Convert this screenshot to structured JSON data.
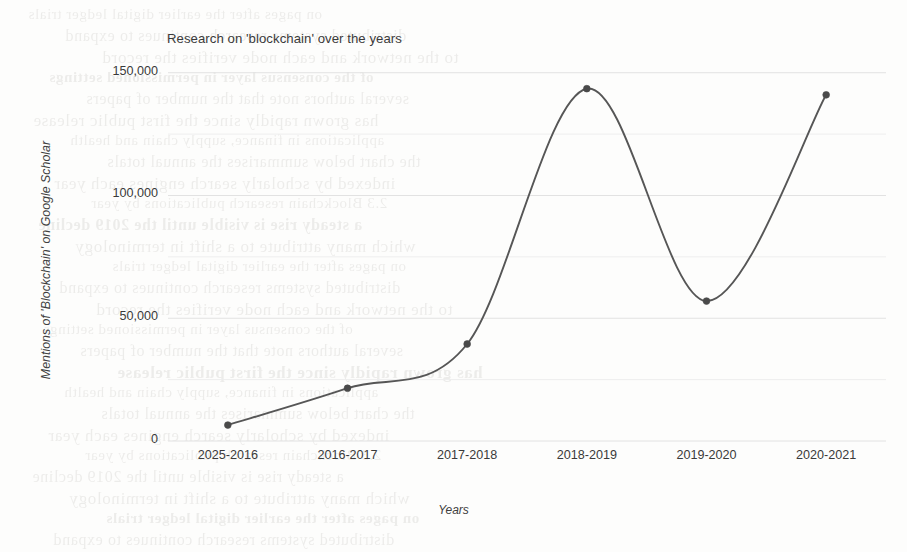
{
  "page": {
    "background_color": "#fdfdfc",
    "ghost_text": [
      "on pages after the earlier digital ledger trials",
      "distributed systems research continues to expand",
      "to the network and each node verifies the record",
      "of the consensus layer in permissioned settings",
      "several authors note that the number of papers",
      "has grown rapidly since the first public release",
      "applications in finance, supply chain and health",
      "the chart below summarises the annual totals",
      "indexed by scholarly search engines each year",
      "2.3  Blockchain research publications by year",
      "a steady rise is visible until the 2019 decline",
      "which many attribute to a shift in terminology"
    ]
  },
  "chart_data": {
    "type": "line",
    "title": "Research on 'blockchain' over the years",
    "xlabel": "Years",
    "ylabel": "Mentions of 'Blockchain' on Google Scholar",
    "categories": [
      "2025-2016",
      "2016-2017",
      "2017-2018",
      "2018-2019",
      "2019-2020",
      "2020-2021"
    ],
    "values": [
      6500,
      21500,
      39500,
      143500,
      57000,
      141000
    ],
    "series": [
      {
        "name": "Mentions of 'Blockchain' on Google Scholar",
        "values": [
          6500,
          21500,
          39500,
          143500,
          57000,
          141000
        ]
      }
    ],
    "ylim": [
      0,
      156000
    ],
    "y_ticks": [
      0,
      50000,
      100000,
      150000
    ],
    "y_tick_labels": [
      "0",
      "50,000",
      "100,000",
      "150,000"
    ],
    "y_minor_ticks": [
      25000,
      75000,
      125000
    ],
    "grid": true,
    "grid_color": "#e2e2e2",
    "minor_grid_color": "#eeeeee",
    "legend": "none",
    "line_color": "#565656",
    "line_width": 1.9,
    "marker": "circle",
    "marker_color": "#4a4a4a",
    "marker_size": 3.4,
    "smoothing": "spline"
  }
}
